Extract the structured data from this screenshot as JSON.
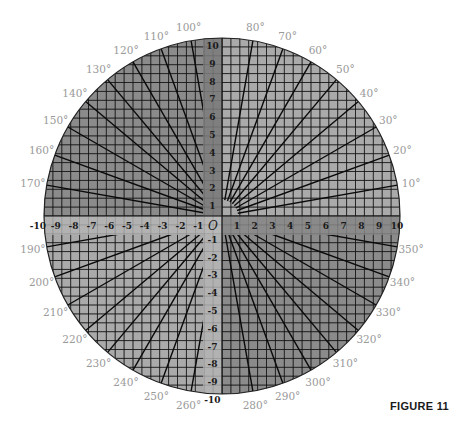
{
  "figure": {
    "caption": "FIGURE 11",
    "origin_label": "O"
  },
  "geometry": {
    "cx": 222,
    "cy": 216,
    "radius": 178,
    "units": 10,
    "band_width": 19
  },
  "colors": {
    "quadrant_1": "#aaaaaa",
    "quadrant_2": "#8b8b8b",
    "quadrant_3": "#aaaaaa",
    "quadrant_4": "#8b8b8b",
    "band_pos_y": "#7f7f7f",
    "band_neg_y": "#b2b2b2",
    "band_pos_x": "#8a8a8a",
    "band_neg_x": "#b2b2b2",
    "center_square": "#b8b8b8",
    "grid_line": "#141414",
    "ray_line": "#0a0a0a",
    "outline": "#222222",
    "angle_label": "#9a9a9a"
  },
  "axes": {
    "x_positive": [
      "1",
      "2",
      "3",
      "4",
      "5",
      "6",
      "7",
      "8",
      "9",
      "10"
    ],
    "x_negative": [
      "-1",
      "-2",
      "-3",
      "-4",
      "-5",
      "-6",
      "-7",
      "-8",
      "-9",
      "-10"
    ],
    "y_positive": [
      "1",
      "2",
      "3",
      "4",
      "5",
      "6",
      "7",
      "8",
      "9",
      "10"
    ],
    "y_negative": [
      "-1",
      "-2",
      "-3",
      "-4",
      "-5",
      "-6",
      "-7",
      "-8",
      "-9",
      "-10"
    ]
  },
  "angles": [
    {
      "deg": 10,
      "label": "10°"
    },
    {
      "deg": 20,
      "label": "20°"
    },
    {
      "deg": 30,
      "label": "30°"
    },
    {
      "deg": 40,
      "label": "40°"
    },
    {
      "deg": 50,
      "label": "50°"
    },
    {
      "deg": 60,
      "label": "60°"
    },
    {
      "deg": 70,
      "label": "70°"
    },
    {
      "deg": 80,
      "label": "80°"
    },
    {
      "deg": 100,
      "label": "100°"
    },
    {
      "deg": 110,
      "label": "110°"
    },
    {
      "deg": 120,
      "label": "120°"
    },
    {
      "deg": 130,
      "label": "130°"
    },
    {
      "deg": 140,
      "label": "140°"
    },
    {
      "deg": 150,
      "label": "150°"
    },
    {
      "deg": 160,
      "label": "160°"
    },
    {
      "deg": 170,
      "label": "170°"
    },
    {
      "deg": 190,
      "label": "190°"
    },
    {
      "deg": 200,
      "label": "200°"
    },
    {
      "deg": 210,
      "label": "210°"
    },
    {
      "deg": 220,
      "label": "220°"
    },
    {
      "deg": 230,
      "label": "230°"
    },
    {
      "deg": 240,
      "label": "240°"
    },
    {
      "deg": 250,
      "label": "250°"
    },
    {
      "deg": 260,
      "label": "260°"
    },
    {
      "deg": 280,
      "label": "280°"
    },
    {
      "deg": 290,
      "label": "290°"
    },
    {
      "deg": 300,
      "label": "300°"
    },
    {
      "deg": 310,
      "label": "310°"
    },
    {
      "deg": 320,
      "label": "320°"
    },
    {
      "deg": 330,
      "label": "330°"
    },
    {
      "deg": 340,
      "label": "340°"
    },
    {
      "deg": 350,
      "label": "350°"
    }
  ]
}
